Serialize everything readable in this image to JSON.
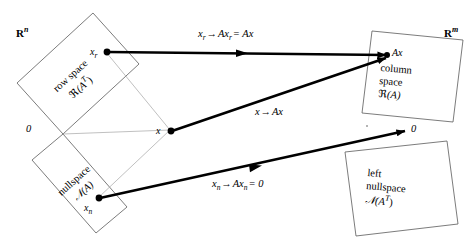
{
  "diagram": {
    "domain_label": {
      "text": "R",
      "superscript": "n"
    },
    "codomain_label": {
      "text": "R",
      "superscript": "m"
    },
    "subspaces": [
      {
        "id": "row-space",
        "line1": "row space",
        "line2_script": "ℜ",
        "line2_arg": "(A",
        "line2_sup": "T",
        "line2_close": ")",
        "rotation": -50
      },
      {
        "id": "nullspace",
        "line1": "nullspace",
        "line2_script": "𝒩",
        "line2_arg": "(A)",
        "line2_sup": "",
        "line2_close": "",
        "rotation": -50
      },
      {
        "id": "column-space",
        "line1": "column",
        "line2": "space",
        "line3_script": "ℜ",
        "line3_arg": "(A)",
        "rotation": 6
      },
      {
        "id": "left-nullspace",
        "line1": "left",
        "line2": "nullspace",
        "line3_script": "𝒩",
        "line3_arg": "(A",
        "line3_sup": "T",
        "line3_close": ")",
        "rotation": 6
      }
    ],
    "points": [
      {
        "id": "x-r",
        "base": "x",
        "sub": "r"
      },
      {
        "id": "x",
        "base": "x",
        "sub": ""
      },
      {
        "id": "x-n",
        "base": "x",
        "sub": "n"
      },
      {
        "id": "Ax",
        "base": "Ax",
        "sub": ""
      }
    ],
    "origins": [
      {
        "id": "origin-left",
        "label": "0"
      },
      {
        "id": "origin-right",
        "label": "0"
      }
    ],
    "mappings": [
      {
        "id": "map-row-space",
        "lhs_base": "x",
        "lhs_sub": "r",
        "arrow": "→",
        "rhs": "Ax",
        "rhs_sub": "r",
        "eq": "= Ax"
      },
      {
        "id": "map-general",
        "lhs_base": "x",
        "lhs_sub": "",
        "arrow": "→",
        "rhs": "Ax",
        "rhs_sub": "",
        "eq": ""
      },
      {
        "id": "map-nullspace",
        "lhs_base": "x",
        "lhs_sub": "n",
        "arrow": "→",
        "rhs": "Ax",
        "rhs_sub": "n",
        "eq": "= 0"
      }
    ],
    "colors": {
      "ink": "#000000",
      "box_stroke": "#555555",
      "thin_stroke": "#9a9a9a",
      "background": "#ffffff"
    }
  }
}
